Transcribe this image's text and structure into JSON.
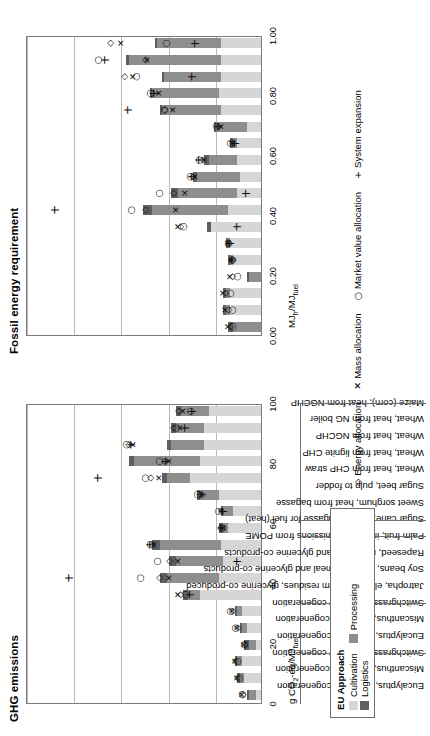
{
  "figure": {
    "panels": [
      {
        "key": "fossil",
        "title": "Fossil energy requirement",
        "axis_caption": "MJfr/MJfuel"
      },
      {
        "key": "ghg",
        "title": "GHG emissions",
        "axis_caption": "g CO2-eq/MJfuel"
      }
    ]
  },
  "categories": [
    "Eucalyptus, electricity cogeneration",
    "Miscanthus, electricity cogeneration",
    "Switchgrass, electricity cogeneration",
    "Eucalyptus, electricity cogeneration",
    "Miscanthus, electricity cogeneration",
    "Switchgrass, electricity cogeneration",
    "Jatropha, electricity from residues, glycerine co-produced",
    "Soy beans, soy bean meal and glycerine co-products",
    "Rapeseed, rape meal and glycerine co-products",
    "Palm fruit, incl. CH4 emissions from POME",
    "Sugar cane, excess bagasse for fuel (heat)",
    "Sweet sorghum, heat from bagasse",
    "Sugar beet, pulp to fodder",
    "Wheat, heat from CHP straw",
    "Wheat, heat from lignite CHP",
    "Wheat, heat from NGCHP",
    "Wheat, heat from NG boiler",
    "Maize (corn), heat from NGCHP"
  ],
  "group_breaks": [
    3,
    6,
    10,
    11,
    18
  ],
  "stack_legend": {
    "title": "EU Approach",
    "items": [
      {
        "label": "Cultivation",
        "color": "#d6d6d6",
        "key": "cultivation"
      },
      {
        "label": "Processing",
        "color": "#8e8e8e",
        "key": "processing"
      },
      {
        "label": "Logistics",
        "color": "#5f5f5f",
        "key": "logistics"
      }
    ]
  },
  "marker_legend": [
    {
      "glyph": "◇",
      "label": "Energy allocation",
      "key": "energy-allocation"
    },
    {
      "glyph": "✕",
      "label": "Mass allocation",
      "key": "mass-allocation"
    },
    {
      "glyph": "○",
      "label": "Market value allocation",
      "key": "market-value-allocation"
    },
    {
      "glyph": "+",
      "label": "System expansion",
      "key": "system-expansion"
    }
  ],
  "chart_data": [
    {
      "type": "bar",
      "key": "fossil",
      "title": "Fossil energy requirement",
      "xlabel": "",
      "ylabel": "MJfr/MJfuel",
      "ylim": [
        0.0,
        1.0
      ],
      "ticks": [
        "0.00",
        "0.20",
        "0.40",
        "0.60",
        "0.80",
        "1.00"
      ],
      "grid": true,
      "stacked": true,
      "categories": [
        "Eucalyptus, electricity cogeneration",
        "Miscanthus, electricity cogeneration",
        "Switchgrass, electricity cogeneration",
        "Eucalyptus, electricity cogeneration",
        "Miscanthus, electricity cogeneration",
        "Switchgrass, electricity cogeneration",
        "Jatropha, electricity from residues, glycerine co-produced",
        "Soy beans, soy bean meal and glycerine co-products",
        "Rapeseed, rape meal and glycerine co-products",
        "Palm fruit, incl. CH4 emissions from POME",
        "Sugar cane, excess bagasse for fuel (heat)",
        "Sweet sorghum, heat from bagasse",
        "Sugar beet, pulp to fodder",
        "Wheat, heat from CHP straw",
        "Wheat, heat from lignite CHP",
        "Wheat, heat from NGCHP",
        "Wheat, heat from NG boiler",
        "Maize (corn), heat from NGCHP"
      ],
      "series": [
        {
          "name": "Cultivation",
          "color": "#d6d6d6",
          "values": [
            0.0,
            0.13,
            0.13,
            0.0,
            0.12,
            0.13,
            0.21,
            0.14,
            0.1,
            0.09,
            0.1,
            0.1,
            0.06,
            0.17,
            0.18,
            0.17,
            0.17,
            0.17
          ]
        },
        {
          "name": "Processing",
          "color": "#8e8e8e",
          "values": [
            0.12,
            0.02,
            0.02,
            0.05,
            0.01,
            0.01,
            0.0,
            0.32,
            0.25,
            0.18,
            0.12,
            0.02,
            0.13,
            0.25,
            0.28,
            0.24,
            0.39,
            0.27
          ]
        },
        {
          "name": "Logistics",
          "color": "#5f5f5f",
          "values": [
            0.02,
            0.01,
            0.01,
            0.01,
            0.01,
            0.01,
            0.02,
            0.04,
            0.03,
            0.02,
            0.02,
            0.01,
            0.01,
            0.01,
            0.01,
            0.01,
            0.01,
            0.01
          ]
        }
      ],
      "markers": [
        {
          "name": "Energy allocation",
          "glyph": "◇",
          "values": [
            0.14,
            0.15,
            0.16,
            0.13,
            0.13,
            0.15,
            0.35,
            0.5,
            0.38,
            0.3,
            0.26,
            0.13,
            0.19,
            0.42,
            0.47,
            0.59,
            0.5,
            0.65
          ]
        },
        {
          "name": "Mass allocation",
          "glyph": "✕",
          "values": [
            0.15,
            0.16,
            0.17,
            0.14,
            0.13,
            0.15,
            0.36,
            0.37,
            0.33,
            0.29,
            0.25,
            0.13,
            0.18,
            0.38,
            0.44,
            0.55,
            0.49,
            0.6
          ]
        },
        {
          "name": "Market value allocation",
          "glyph": "○",
          "values": [
            0.13,
            0.13,
            0.14,
            0.11,
            0.13,
            0.15,
            0.34,
            0.56,
            0.44,
            0.31,
            0.27,
            0.14,
            0.2,
            0.42,
            0.48,
            0.54,
            0.7,
            0.41
          ]
        },
        {
          "name": "System expansion",
          "glyph": "+",
          "values": [
            null,
            null,
            null,
            null,
            0.13,
            0.14,
            0.11,
            0.88,
            0.07,
            0.3,
            0.27,
            0.12,
            0.19,
            0.57,
            0.46,
            0.3,
            0.67,
            0.29
          ]
        }
      ]
    },
    {
      "type": "bar",
      "key": "ghg",
      "title": "GHG emissions",
      "xlabel": "",
      "ylabel": "g CO2-eq/MJfuel",
      "ylim": [
        0,
        100
      ],
      "ticks": [
        "0",
        "20",
        "40",
        "60",
        "80",
        "100"
      ],
      "grid": true,
      "stacked": true,
      "categories": [
        "Eucalyptus, electricity cogeneration",
        "Miscanthus, electricity cogeneration",
        "Switchgrass, electricity cogeneration",
        "Eucalyptus, electricity cogeneration",
        "Miscanthus, electricity cogeneration",
        "Switchgrass, electricity cogeneration",
        "Jatropha, electricity from residues, glycerine co-produced",
        "Soy beans, soy bean meal and glycerine co-products",
        "Rapeseed, rape meal and glycerine co-products",
        "Palm fruit, incl. CH4 emissions from POME",
        "Sugar cane, excess bagasse for fuel (heat)",
        "Sweet sorghum, heat from bagasse",
        "Sugar beet, pulp to fodder",
        "Wheat, heat from CHP straw",
        "Wheat, heat from lignite CHP",
        "Wheat, heat from NGCHP",
        "Wheat, heat from NG boiler",
        "Maize (corn), heat from NGCHP"
      ],
      "series": [
        {
          "name": "Cultivation",
          "color": "#d6d6d6",
          "values": [
            2,
            7,
            8,
            2,
            6,
            8,
            26,
            18,
            16,
            17,
            14,
            12,
            18,
            30,
            26,
            24,
            24,
            22
          ]
        },
        {
          "name": "Processing",
          "color": "#8e8e8e",
          "values": [
            3,
            2,
            2,
            3,
            2,
            2,
            5,
            22,
            20,
            26,
            2,
            4,
            8,
            10,
            28,
            14,
            12,
            12
          ]
        },
        {
          "name": "Logistics",
          "color": "#5f5f5f",
          "values": [
            1,
            1,
            1,
            2,
            1,
            1,
            2,
            3,
            3,
            3,
            2,
            1,
            1,
            2,
            2,
            2,
            2,
            2
          ]
        }
      ],
      "markers": [
        {
          "name": "Energy allocation",
          "glyph": "◇",
          "values": [
            9,
            11,
            12,
            8,
            11,
            13,
            35,
            44,
            40,
            47,
            17,
            18,
            27,
            48,
            42,
            57,
            38,
            36
          ]
        },
        {
          "name": "Mass allocation",
          "glyph": "✕",
          "values": [
            9,
            11,
            12,
            8,
            11,
            13,
            36,
            40,
            36,
            46,
            17,
            18,
            26,
            44,
            40,
            55,
            35,
            34
          ]
        },
        {
          "name": "Market value allocation",
          "glyph": "○",
          "values": [
            9,
            10,
            11,
            8,
            12,
            14,
            33,
            52,
            45,
            48,
            18,
            19,
            28,
            50,
            44,
            58,
            37,
            31
          ]
        },
        {
          "name": "System expansion",
          "glyph": "+",
          "values": [
            null,
            null,
            null,
            null,
            null,
            null,
            31,
            82,
            11,
            48,
            18,
            17,
            26,
            70,
            41,
            56,
            33,
            30
          ]
        }
      ]
    }
  ]
}
